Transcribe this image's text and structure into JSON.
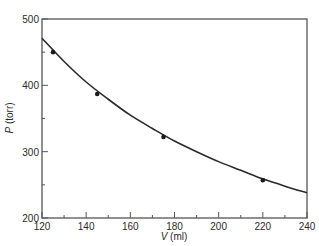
{
  "chart_data": {
    "type": "line",
    "title": "",
    "xlabel": "V (ml)",
    "ylabel": "P (torr)",
    "xlabel_var": "V",
    "xlabel_unit": " (ml)",
    "ylabel_var": "P",
    "ylabel_unit": " (torr)",
    "xlim": [
      120,
      240
    ],
    "ylim": [
      200,
      500
    ],
    "x_ticks": [
      120,
      140,
      160,
      180,
      200,
      220,
      240
    ],
    "x_minor_ticks": [
      130,
      150,
      170,
      190,
      210,
      230
    ],
    "y_ticks": [
      200,
      300,
      400,
      500
    ],
    "y_minor_ticks": [
      250,
      350,
      450
    ],
    "grid": false,
    "legend": null,
    "series": [
      {
        "name": "measured",
        "style": "markers",
        "x": [
          125,
          145,
          175,
          220
        ],
        "y": [
          450,
          387,
          322,
          257
        ]
      },
      {
        "name": "fitted curve (PV = constant)",
        "style": "smooth-line",
        "x": [
          120,
          130,
          140,
          150,
          160,
          170,
          180,
          190,
          200,
          210,
          220,
          230,
          240
        ],
        "y": [
          471,
          436,
          405,
          379,
          355,
          335,
          316,
          300,
          285,
          272,
          259,
          248,
          238
        ]
      }
    ],
    "colors": {
      "axis": "#555555",
      "line": "#2a2a2a",
      "marker": "#1a1a1a"
    }
  }
}
